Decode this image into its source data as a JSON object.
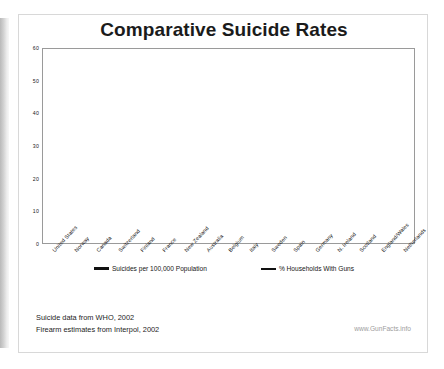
{
  "chart_data": {
    "type": "line",
    "title": "Comparative Suicide Rates",
    "xlabel": "",
    "ylabel": "",
    "ylim": [
      0,
      60
    ],
    "yticks": [
      0,
      10,
      20,
      30,
      40,
      50,
      60
    ],
    "grid": true,
    "legend_position": "bottom",
    "categories": [
      "United States",
      "Norway",
      "Canada",
      "Switzerland",
      "Finland",
      "France",
      "New Zealand",
      "Australia",
      "Belgium",
      "Italy",
      "Sweden",
      "Spain",
      "Germany",
      "N. Ireland",
      "Scotland",
      "England/Wales",
      "Netherlands"
    ],
    "series": [
      {
        "name": "Suicides per 100,000 Population",
        "style": "solid",
        "color": "#111111",
        "values": [
          12,
          13,
          13,
          13,
          27,
          19,
          13,
          13,
          19,
          8,
          15,
          11,
          15,
          8,
          12,
          8,
          10
        ]
      },
      {
        "name": "% Households With Guns",
        "style": "dashed",
        "color": "#3a3a3a",
        "values": [
          48,
          32,
          30,
          28,
          25,
          23,
          22,
          19,
          17,
          16,
          15,
          13,
          12,
          9,
          8,
          5,
          2
        ]
      }
    ]
  },
  "legend": [
    {
      "label": "Suicides per 100,000 Population",
      "style": "solid"
    },
    {
      "label": "% Households With Guns",
      "style": "dashed"
    }
  ],
  "footer": {
    "line1": "Suicide data from WHO, 2002",
    "line2": "Firearm estimates from Interpol, 2002",
    "watermark": "www.GunFacts.info"
  }
}
